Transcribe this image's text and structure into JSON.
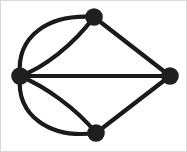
{
  "figure": {
    "kind": "undirected-multigraph-diagram",
    "width": 187,
    "height": 152,
    "background_color": "#ffffff",
    "stroke_color": "#1a1a1a",
    "node_fill_color": "#1f1f1f",
    "border_color": "#b9b9b9",
    "edge_stroke_width": 4.2,
    "node_radius": 8.8
  },
  "graph_data": {
    "type": "graph",
    "directed": false,
    "multigraph": true,
    "node_count": 4,
    "edge_count": 7,
    "nodes": [
      {
        "id": "left",
        "label": "",
        "x": 20,
        "y": 76,
        "degree": 5
      },
      {
        "id": "top",
        "label": "",
        "x": 94,
        "y": 17,
        "degree": 3
      },
      {
        "id": "right",
        "label": "",
        "x": 170,
        "y": 76,
        "degree": 3
      },
      {
        "id": "bottom",
        "label": "",
        "x": 96,
        "y": 133,
        "degree": 3
      }
    ],
    "edges": [
      {
        "id": "left-top-outer",
        "source": "left",
        "target": "top",
        "shape": "curved",
        "bulge": "up-left",
        "path": "M 20 76 C 16 36 48 14 94 17"
      },
      {
        "id": "left-top-inner",
        "source": "left",
        "target": "top",
        "shape": "curved",
        "bulge": "down-right",
        "path": "M 20 76 C 44 68 74 44 94 17"
      },
      {
        "id": "left-right-straight",
        "source": "left",
        "target": "right",
        "shape": "straight",
        "bulge": "none",
        "path": "M 20 76 L 170 76"
      },
      {
        "id": "left-bottom-outer",
        "source": "left",
        "target": "bottom",
        "shape": "curved",
        "bulge": "down-left",
        "path": "M 20 76 C 16 116 50 139 96 133"
      },
      {
        "id": "left-bottom-inner",
        "source": "left",
        "target": "bottom",
        "shape": "curved",
        "bulge": "up-right",
        "path": "M 20 76 C 44 86 76 108 96 133"
      },
      {
        "id": "top-right-straight",
        "source": "top",
        "target": "right",
        "shape": "straight",
        "bulge": "none",
        "path": "M 94 17 L 170 76"
      },
      {
        "id": "bottom-right-straight",
        "source": "bottom",
        "target": "right",
        "shape": "straight",
        "bulge": "none",
        "path": "M 96 133 L 170 76"
      }
    ]
  }
}
